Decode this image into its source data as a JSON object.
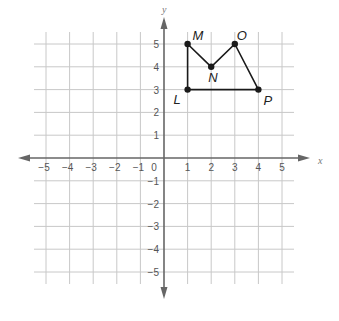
{
  "chart_data": {
    "type": "scatter",
    "title": "",
    "xlabel": "x",
    "ylabel": "y",
    "xlim": [
      -5,
      5
    ],
    "ylim": [
      -5,
      5
    ],
    "grid": true,
    "x_ticks": [
      "-5",
      "-4",
      "-3",
      "-2",
      "-1",
      "1",
      "2",
      "3",
      "4",
      "5"
    ],
    "y_ticks": [
      "5",
      "4",
      "3",
      "2",
      "1",
      "-1",
      "-2",
      "-3",
      "-4",
      "-5"
    ],
    "origin_label": "0",
    "points": [
      {
        "name": "L",
        "x": 1,
        "y": 3
      },
      {
        "name": "M",
        "x": 1,
        "y": 5
      },
      {
        "name": "N",
        "x": 2,
        "y": 4
      },
      {
        "name": "O",
        "x": 3,
        "y": 5
      },
      {
        "name": "P",
        "x": 4,
        "y": 3
      }
    ],
    "polygon": [
      "L",
      "M",
      "N",
      "O",
      "P"
    ]
  },
  "colors": {
    "grid": "#c8c8c8",
    "axis": "#666666",
    "shape": "#1a1a1a"
  }
}
